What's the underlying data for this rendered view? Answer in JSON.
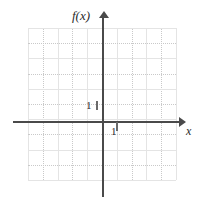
{
  "figure": {
    "kind": "coordinate-plane",
    "background": "#ffffff"
  },
  "axes": {
    "y_label": "f(x)",
    "x_label": "x",
    "axis_color": "#4a4a4a",
    "grid_color": "#c9c9c9",
    "grid_major_color": "#e4e4e4"
  },
  "ticks": {
    "y_unit_label": "1",
    "x_unit_label": "1"
  },
  "chart_data": {
    "type": "line",
    "title": "",
    "xlabel": "x",
    "ylabel": "f(x)",
    "xlim": [
      -5,
      5
    ],
    "ylim": [
      -4,
      6
    ],
    "grid": true,
    "legend": null,
    "series": [],
    "annotations": [
      {
        "text": "1",
        "axis": "y",
        "value": 1
      },
      {
        "text": "1",
        "axis": "x",
        "value": 1
      }
    ]
  }
}
